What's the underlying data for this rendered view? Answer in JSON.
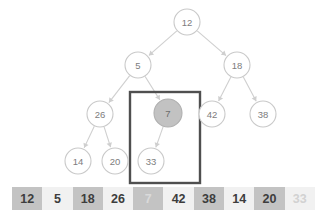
{
  "diagram": {
    "background_color": "#ffffff",
    "node_stroke_color": "#c9c9c9",
    "node_text_color": "#7d7d7d",
    "edge_color": "#cfcfcf",
    "highlight_fill": "#c2c2c2",
    "focus_box_color": "#4f4f4f"
  },
  "tree": {
    "nodes": [
      {
        "id": "n12",
        "label": "12",
        "cx": 187,
        "cy": 22,
        "r": 13,
        "highlighted": false
      },
      {
        "id": "n5",
        "label": "5",
        "cx": 138,
        "cy": 65,
        "r": 13,
        "highlighted": false
      },
      {
        "id": "n18",
        "label": "18",
        "cx": 237,
        "cy": 65,
        "r": 13,
        "highlighted": false
      },
      {
        "id": "n26",
        "label": "26",
        "cx": 100,
        "cy": 114,
        "r": 13,
        "highlighted": false
      },
      {
        "id": "n7",
        "label": "7",
        "cx": 168,
        "cy": 113,
        "r": 14,
        "highlighted": true
      },
      {
        "id": "n42",
        "label": "42",
        "cx": 212,
        "cy": 114,
        "r": 13,
        "highlighted": false
      },
      {
        "id": "n38",
        "label": "38",
        "cx": 263,
        "cy": 114,
        "r": 13,
        "highlighted": false
      },
      {
        "id": "n14",
        "label": "14",
        "cx": 78,
        "cy": 161,
        "r": 13,
        "highlighted": false
      },
      {
        "id": "n20",
        "label": "20",
        "cx": 115,
        "cy": 161,
        "r": 13,
        "highlighted": false
      },
      {
        "id": "n33",
        "label": "33",
        "cx": 151,
        "cy": 161,
        "r": 13,
        "highlighted": false
      }
    ],
    "edges": [
      {
        "from": "n12",
        "to": "n5"
      },
      {
        "from": "n12",
        "to": "n18"
      },
      {
        "from": "n5",
        "to": "n26"
      },
      {
        "from": "n5",
        "to": "n7"
      },
      {
        "from": "n18",
        "to": "n42"
      },
      {
        "from": "n18",
        "to": "n38"
      },
      {
        "from": "n26",
        "to": "n14"
      },
      {
        "from": "n26",
        "to": "n20"
      },
      {
        "from": "n7",
        "to": "n33"
      }
    ],
    "focus_box": {
      "x": 130,
      "y": 92,
      "width": 70,
      "height": 91
    }
  },
  "array": {
    "cells": [
      {
        "value": "12",
        "shaded": true,
        "faded": false
      },
      {
        "value": "5",
        "shaded": false,
        "faded": false
      },
      {
        "value": "18",
        "shaded": true,
        "faded": false
      },
      {
        "value": "26",
        "shaded": false,
        "faded": false
      },
      {
        "value": "7",
        "shaded": true,
        "faded": true
      },
      {
        "value": "42",
        "shaded": false,
        "faded": false
      },
      {
        "value": "38",
        "shaded": true,
        "faded": false
      },
      {
        "value": "14",
        "shaded": false,
        "faded": false
      },
      {
        "value": "20",
        "shaded": true,
        "faded": false
      },
      {
        "value": "33",
        "shaded": false,
        "faded": true
      }
    ]
  }
}
